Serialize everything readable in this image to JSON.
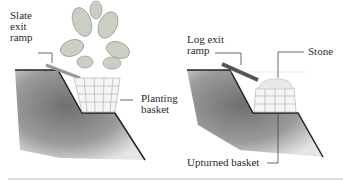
{
  "left_panel": {
    "labels": {
      "ramp": "Slate\nexit\nramp",
      "basket": "Planting\nbasket"
    }
  },
  "right_panel": {
    "labels": {
      "ramp": "Log exit\nramp",
      "stone": "Stone",
      "basket": "Upturned basket"
    }
  }
}
